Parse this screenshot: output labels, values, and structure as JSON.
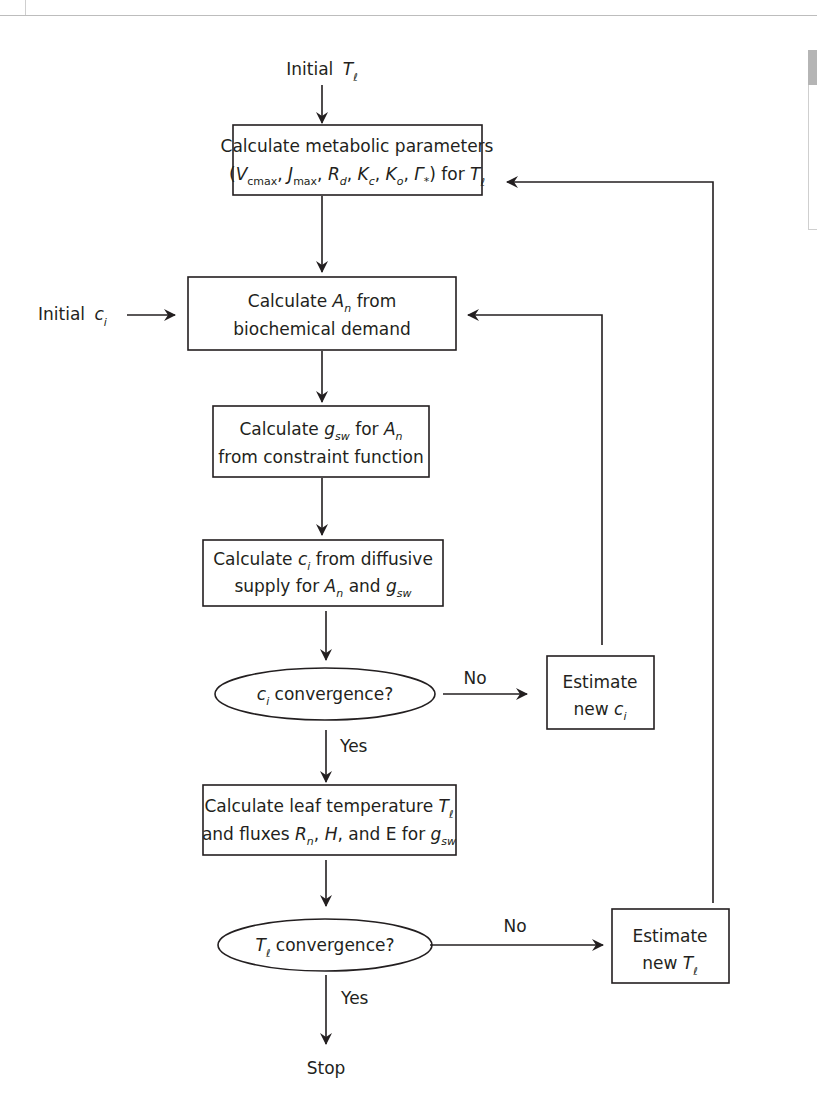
{
  "diagram": {
    "type": "flowchart",
    "start": {
      "text": "Initial",
      "var": "T",
      "sub": "ℓ"
    },
    "initial_ci": {
      "text": "Initial",
      "var": "c",
      "sub": "i"
    },
    "steps": [
      {
        "id": "metabolic",
        "line1": "Calculate metabolic parameters",
        "line2_parts": [
          "(V",
          "cmax",
          ", J",
          "max",
          ", R",
          "d",
          ", K",
          "c",
          ", K",
          "o",
          ", Γ",
          "*",
          ") for T",
          "ℓ"
        ]
      },
      {
        "id": "An",
        "line1_a": "Calculate ",
        "line1_var": "A",
        "line1_sub": "n",
        "line1_b": " from",
        "line2": "biochemical demand"
      },
      {
        "id": "gsw",
        "line1_a": "Calculate ",
        "line1_var": "g",
        "line1_sub": "sw",
        "line1_b": " for ",
        "line1_var2": "A",
        "line1_sub2": "n",
        "line2": "from constraint function"
      },
      {
        "id": "ci",
        "line1_a": "Calculate ",
        "line1_var": "c",
        "line1_sub": "i",
        "line1_b": " from diffusive",
        "line2_a": "supply for ",
        "line2_var": "A",
        "line2_sub": "n",
        "line2_b": " and ",
        "line2_var2": "g",
        "line2_sub2": "sw"
      },
      {
        "id": "leaf",
        "line1_a": "Calculate leaf temperature ",
        "line1_var": "T",
        "line1_sub": "ℓ",
        "line2_a": "and fluxes ",
        "line2_var": "R",
        "line2_sub": "n",
        "line2_b": ", ",
        "line2_var2": "H",
        "line2_c": ", and E for ",
        "line2_var3": "g",
        "line2_sub3": "sw"
      }
    ],
    "decisions": [
      {
        "id": "ci_conv",
        "var": "c",
        "sub": "i",
        "text": " convergence?",
        "no": "No",
        "yes": "Yes"
      },
      {
        "id": "tl_conv",
        "var": "T",
        "sub": "ℓ",
        "text": " convergence?",
        "no": "No",
        "yes": "Yes"
      }
    ],
    "loops": [
      {
        "id": "est_ci",
        "line1": "Estimate",
        "line2_a": "new ",
        "line2_var": "c",
        "line2_sub": "i"
      },
      {
        "id": "est_tl",
        "line1": "Estimate",
        "line2_a": "new ",
        "line2_var": "T",
        "line2_sub": "ℓ"
      }
    ],
    "end": "Stop",
    "colors": {
      "stroke": "#231f20",
      "text": "#231f20",
      "background": "#ffffff"
    }
  }
}
